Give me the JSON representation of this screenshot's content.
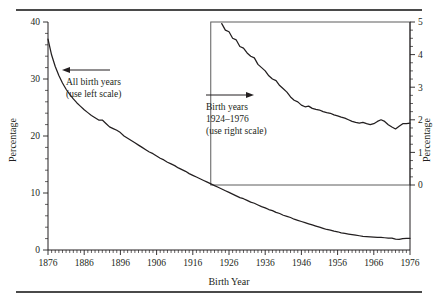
{
  "figure": {
    "top_rule": "",
    "bottom_rule": ""
  },
  "chart_data": {
    "type": "line",
    "title": "",
    "xlabel": "Birth Year",
    "ylabel": "Percentage",
    "ylabel_right": "Percentage",
    "xlim": [
      1876,
      1976
    ],
    "ylim": [
      0,
      40
    ],
    "ylim_right": [
      0,
      5
    ],
    "grid": false,
    "legend_position": "inline-annotations",
    "x_ticks": [
      1876,
      1886,
      1896,
      1906,
      1916,
      1926,
      1936,
      1946,
      1956,
      1966,
      1976
    ],
    "x_tick_labels": [
      "1876",
      "1886",
      "1896",
      "1906",
      "1916",
      "1926",
      "1936",
      "1946",
      "1956",
      "1966",
      "1976"
    ],
    "x_minor_tick_step": 1,
    "y_ticks_left": [
      0,
      10,
      20,
      30,
      40
    ],
    "y_tick_labels_left": [
      "0",
      "10",
      "20",
      "30",
      "40"
    ],
    "y_minor_tick_step_left": 2,
    "y_ticks_right": [
      0,
      1,
      2,
      3,
      4,
      5
    ],
    "y_tick_labels_right": [
      "0",
      "1",
      "2",
      "3",
      "4",
      "5"
    ],
    "y_minor_tick_step_right": 0.25,
    "annotations": [
      {
        "id": "all-birth-years",
        "lines": [
          "All birth years",
          "(use left scale)"
        ],
        "arrow_direction": "left",
        "scale": "left"
      },
      {
        "id": "birth-years-1924-1976",
        "lines": [
          "Birth years",
          "1924–1976",
          "(use right scale)"
        ],
        "arrow_direction": "right",
        "scale": "right"
      }
    ],
    "series": [
      {
        "name": "All birth years",
        "axis": "left",
        "x": [
          1876,
          1877,
          1878,
          1879,
          1880,
          1881,
          1882,
          1883,
          1884,
          1885,
          1886,
          1887,
          1888,
          1889,
          1890,
          1891,
          1892,
          1893,
          1894,
          1895,
          1896,
          1897,
          1898,
          1899,
          1900,
          1901,
          1902,
          1903,
          1904,
          1905,
          1906,
          1907,
          1908,
          1909,
          1910,
          1911,
          1912,
          1913,
          1914,
          1915,
          1916,
          1917,
          1918,
          1919,
          1920,
          1921,
          1922,
          1923,
          1924,
          1925,
          1926,
          1927,
          1928,
          1929,
          1930,
          1931,
          1932,
          1933,
          1934,
          1935,
          1936,
          1937,
          1938,
          1939,
          1940,
          1941,
          1942,
          1943,
          1944,
          1945,
          1946,
          1947,
          1948,
          1949,
          1950,
          1951,
          1952,
          1953,
          1954,
          1955,
          1956,
          1957,
          1958,
          1959,
          1960,
          1961,
          1962,
          1963,
          1964,
          1965,
          1966,
          1967,
          1968,
          1969,
          1970,
          1971,
          1972,
          1973,
          1974,
          1975,
          1976
        ],
        "values": [
          37.0,
          34.2,
          32.2,
          30.6,
          29.3,
          28.2,
          27.3,
          26.5,
          25.8,
          25.2,
          24.6,
          24.1,
          23.6,
          23.2,
          22.8,
          22.8,
          22.2,
          21.6,
          21.3,
          21.0,
          20.6,
          20.0,
          19.6,
          19.2,
          18.8,
          18.4,
          18.0,
          17.6,
          17.2,
          16.9,
          16.5,
          16.1,
          15.8,
          15.4,
          15.1,
          14.8,
          14.4,
          14.1,
          13.8,
          13.4,
          13.1,
          12.8,
          12.5,
          12.2,
          11.9,
          11.6,
          11.3,
          11.0,
          10.7,
          10.4,
          10.1,
          9.8,
          9.5,
          9.2,
          9.0,
          8.7,
          8.4,
          8.2,
          7.9,
          7.6,
          7.4,
          7.1,
          6.9,
          6.6,
          6.4,
          6.1,
          5.9,
          5.7,
          5.4,
          5.2,
          5.0,
          4.8,
          4.6,
          4.4,
          4.2,
          4.0,
          3.8,
          3.6,
          3.5,
          3.3,
          3.2,
          3.0,
          2.9,
          2.8,
          2.7,
          2.6,
          2.5,
          2.4,
          2.35,
          2.3,
          2.25,
          2.2,
          2.2,
          2.15,
          2.1,
          2.1,
          1.9,
          1.85,
          2.0,
          2.05,
          2.05
        ]
      },
      {
        "name": "Birth years 1924–1976",
        "axis": "right",
        "x": [
          1924,
          1925,
          1926,
          1927,
          1928,
          1929,
          1930,
          1931,
          1932,
          1933,
          1934,
          1935,
          1936,
          1937,
          1938,
          1939,
          1940,
          1941,
          1942,
          1943,
          1944,
          1945,
          1946,
          1947,
          1948,
          1949,
          1950,
          1951,
          1952,
          1953,
          1954,
          1955,
          1956,
          1957,
          1958,
          1959,
          1960,
          1961,
          1962,
          1963,
          1964,
          1965,
          1966,
          1967,
          1968,
          1969,
          1970,
          1971,
          1972,
          1973,
          1974,
          1975,
          1976
        ],
        "values": [
          4.95,
          4.75,
          4.7,
          4.5,
          4.45,
          4.25,
          4.2,
          4.05,
          3.95,
          3.9,
          3.7,
          3.6,
          3.5,
          3.35,
          3.25,
          3.2,
          3.05,
          2.95,
          2.85,
          2.7,
          2.6,
          2.55,
          2.45,
          2.4,
          2.42,
          2.35,
          2.32,
          2.3,
          2.25,
          2.22,
          2.2,
          2.15,
          2.12,
          2.08,
          2.05,
          2.0,
          1.95,
          1.92,
          1.9,
          1.92,
          1.88,
          1.85,
          1.88,
          1.95,
          2.0,
          1.95,
          1.85,
          1.78,
          1.72,
          1.8,
          1.88,
          1.88,
          1.9
        ]
      }
    ]
  }
}
